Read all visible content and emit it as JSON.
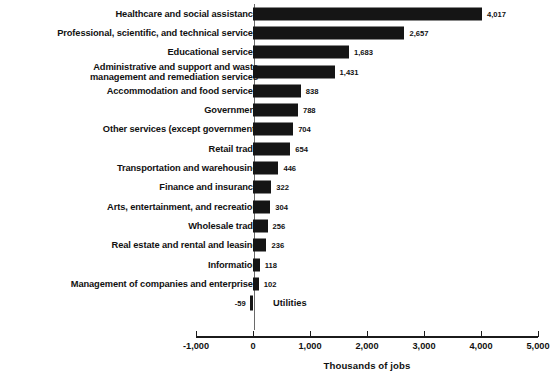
{
  "chart_data": {
    "type": "bar",
    "orientation": "horizontal",
    "title": "",
    "subtitle": "",
    "xlabel": "Thousands of jobs",
    "ylabel": "",
    "xlim": [
      -1000,
      5000
    ],
    "xticks": [
      -1000,
      0,
      1000,
      2000,
      3000,
      4000,
      5000
    ],
    "xtick_labels": [
      "-1,000",
      "0",
      "1,000",
      "2,000",
      "3,000",
      "4,000",
      "5,000"
    ],
    "grid": false,
    "legend": null,
    "bar_color": "#151515",
    "categories": [
      "Healthcare and social assistance",
      "Professional, scientific, and technical services",
      "Educational services",
      "Administrative and support and waste\nmanagement and remediation services",
      "Accommodation and food services",
      "Government",
      "Other services (except government)",
      "Retail trade",
      "Transportation and warehousing",
      "Finance and insurance",
      "Arts, entertainment, and recreation",
      "Wholesale trade",
      "Real estate and rental and leasing",
      "Information",
      "Management of companies and enterprises",
      "Utilities"
    ],
    "values": [
      4017,
      2657,
      1683,
      1431,
      838,
      788,
      704,
      654,
      446,
      322,
      304,
      256,
      236,
      118,
      102,
      -59
    ],
    "value_labels": [
      "4,017",
      "2,657",
      "1,683",
      "1,431",
      "838",
      "788",
      "704",
      "654",
      "446",
      "322",
      "304",
      "256",
      "236",
      "118",
      "102",
      "-59"
    ]
  },
  "axis": {
    "title": "Thousands of jobs"
  }
}
